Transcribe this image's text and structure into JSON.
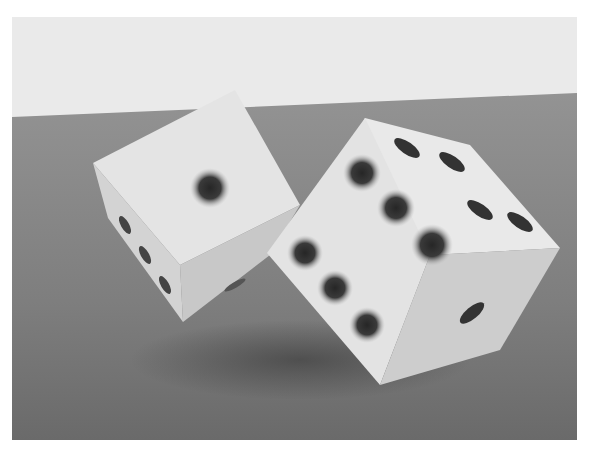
{
  "image": {
    "subject": "Two rendered dice on a gray surface",
    "caption": "Two white dice with dark blurred pips, tilted on a table",
    "colors": {
      "page_bg": "#ffffff",
      "sky": "#e9e9e9",
      "table_far": "#8f8f8f",
      "table_near": "#6f6f6f",
      "die_face": "#e6e6e6",
      "die_side": "#cfcfcf",
      "pip": "#2e2e2e"
    },
    "dice": [
      {
        "name": "left-die",
        "front_face_value": 1
      },
      {
        "name": "right-die",
        "front_face_value": 5,
        "top_face_value": 4,
        "side_face_value": 1
      }
    ]
  }
}
